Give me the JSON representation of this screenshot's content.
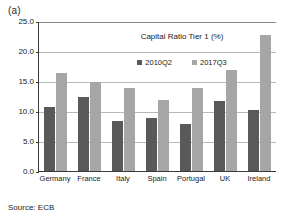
{
  "panel": {
    "label": "(a)"
  },
  "source": {
    "text": "Source: ECB"
  },
  "legend": {
    "position": "inside-top-center",
    "items": [
      {
        "name": "2010Q2",
        "color": "#595959"
      },
      {
        "name": "2017Q3",
        "color": "#a6a6a6"
      }
    ]
  },
  "axis": {
    "yticks": [
      "25.0",
      "20.0",
      "15.0",
      "10.0",
      "5.0",
      "0.0"
    ]
  },
  "chart_data": {
    "type": "bar",
    "title": "Capital Ratio Tier 1 (%)",
    "xlabel": "",
    "ylabel": "",
    "ylim": [
      0,
      25
    ],
    "ytick_values": [
      0,
      5,
      10,
      15,
      20,
      25
    ],
    "grid": true,
    "legend_position": "inside top center",
    "categories": [
      "Germany",
      "France",
      "Italy",
      "Spain",
      "Portugal",
      "UK",
      "Ireland"
    ],
    "series": [
      {
        "name": "2010Q2",
        "color": "#595959",
        "values": [
          10.6,
          12.3,
          8.4,
          8.9,
          7.9,
          11.7,
          10.2
        ]
      },
      {
        "name": "2017Q3",
        "color": "#a6a6a6",
        "values": [
          16.3,
          14.9,
          13.8,
          11.8,
          13.9,
          16.9,
          22.7
        ]
      }
    ]
  }
}
